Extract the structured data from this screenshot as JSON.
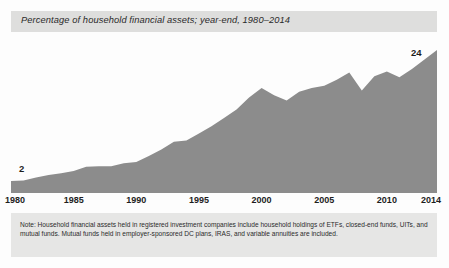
{
  "title": "Percentage of household financial assets; year-end, 1980–2014",
  "value_labels": {
    "start": "2",
    "end": "24"
  },
  "note": "Note: Household financial assets held in registered investment companies include household holdings of ETFs, closed-end funds, UITs, and mutual funds. Mutual funds held in employer-sponsored DC plans, IRAS, and variable annuities are included.",
  "colors": {
    "area_fill": "#8c8c8c",
    "title_bar": "#dededd",
    "note_bar": "#e6e6e5",
    "text": "#1d1d1d",
    "page_background": "#fdfdfd"
  },
  "chart_data": {
    "type": "area",
    "title": "Percentage of household financial assets; year-end, 1980–2014",
    "xlabel": "",
    "ylabel": "",
    "grid": false,
    "legend": null,
    "xlim": [
      1980,
      2014
    ],
    "ylim": [
      0,
      26
    ],
    "tick_labels": [
      "1980",
      "1985",
      "1990",
      "1995",
      "2000",
      "2005",
      "2010",
      "2014"
    ],
    "ticks": [
      1980,
      1985,
      1990,
      1995,
      2000,
      2005,
      2010,
      2014
    ],
    "annotations": [
      {
        "x": 1980,
        "value": 2,
        "text": "2"
      },
      {
        "x": 2014,
        "value": 24,
        "text": "24"
      }
    ],
    "x": [
      1980,
      1981,
      1982,
      1983,
      1984,
      1985,
      1986,
      1987,
      1988,
      1989,
      1990,
      1991,
      1992,
      1993,
      1994,
      1995,
      1996,
      1997,
      1998,
      1999,
      2000,
      2001,
      2002,
      2003,
      2004,
      2005,
      2006,
      2007,
      2008,
      2009,
      2010,
      2011,
      2012,
      2013,
      2014
    ],
    "values": [
      2,
      2.1,
      2.6,
      3.0,
      3.3,
      3.7,
      4.4,
      4.5,
      4.5,
      5.0,
      5.2,
      6.2,
      7.3,
      8.6,
      8.8,
      10.0,
      11.2,
      12.6,
      14.0,
      16.0,
      17.6,
      16.4,
      15.5,
      17.0,
      17.6,
      18.0,
      19.0,
      20.2,
      17.2,
      19.6,
      20.4,
      19.4,
      20.8,
      22.4,
      24
    ]
  }
}
